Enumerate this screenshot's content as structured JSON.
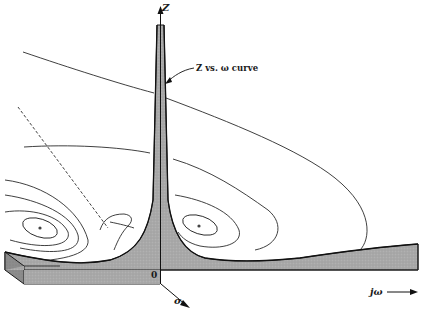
{
  "figure": {
    "labels": {
      "z_axis": "Z",
      "callout": "Z vs. ω curve",
      "origin": "0",
      "sigma_axis": "σ",
      "jw_axis": "jω"
    },
    "elements": {
      "spike": "Central peak of |Z| rising along the Z axis at the origin",
      "surface_slab": "Shaded cross-section of the surface along the jω axis",
      "contours": "Constant-|Z| contour lines surrounding poles on either side of the origin",
      "dashed_line": "Dashed reference line descending from upper left toward the spike base",
      "pole_markers": [
        "left pole marker",
        "right pole marker"
      ]
    },
    "colors": {
      "ink": "#1a1a1a",
      "surface_fill": "#a9a9a9",
      "slab_side": "#8c8c8c",
      "background": "#ffffff"
    }
  }
}
